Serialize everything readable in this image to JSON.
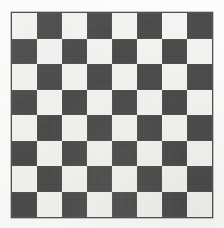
{
  "scene": {
    "title": "Checkerboard",
    "background_color": "#fdfdfc",
    "width_px": 224,
    "height_px": 228
  },
  "board": {
    "label": "checkerboard",
    "rows": 8,
    "columns": 8,
    "total_squares": 64,
    "left_px": 11,
    "top_px": 12,
    "width_px": 202,
    "height_px": 206,
    "square_size_px": 25,
    "border_color": "#4f5152",
    "border_width_px": 1,
    "light_square_color": "#f6f6f4",
    "dark_square_color": "#4a4a4a",
    "top_left_square": "light",
    "top_right_square": "dark",
    "bottom_left_square": "dark",
    "bottom_right_square": "light",
    "pattern": [
      [
        "light",
        "dark",
        "light",
        "dark",
        "light",
        "dark",
        "light",
        "dark"
      ],
      [
        "dark",
        "light",
        "dark",
        "light",
        "dark",
        "light",
        "dark",
        "light"
      ],
      [
        "light",
        "dark",
        "light",
        "dark",
        "light",
        "dark",
        "light",
        "dark"
      ],
      [
        "dark",
        "light",
        "dark",
        "light",
        "dark",
        "light",
        "dark",
        "light"
      ],
      [
        "light",
        "dark",
        "light",
        "dark",
        "light",
        "dark",
        "light",
        "dark"
      ],
      [
        "dark",
        "light",
        "dark",
        "light",
        "dark",
        "light",
        "dark",
        "light"
      ],
      [
        "light",
        "dark",
        "light",
        "dark",
        "light",
        "dark",
        "light",
        "dark"
      ],
      [
        "dark",
        "light",
        "dark",
        "light",
        "dark",
        "light",
        "dark",
        "light"
      ]
    ]
  }
}
